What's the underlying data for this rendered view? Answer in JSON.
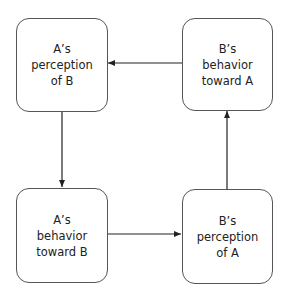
{
  "diagram": {
    "type": "cycle",
    "nodes": [
      {
        "id": "a_perception",
        "label": "A’s\nperception\nof B"
      },
      {
        "id": "b_behavior",
        "label": "B’s\nbehavior\ntoward A"
      },
      {
        "id": "a_behavior",
        "label": "A’s\nbehavior\ntoward B"
      },
      {
        "id": "b_perception",
        "label": "B’s\nperception\nof A"
      }
    ],
    "edges": [
      {
        "from": "a_perception",
        "to": "a_behavior"
      },
      {
        "from": "a_behavior",
        "to": "b_perception"
      },
      {
        "from": "b_perception",
        "to": "b_behavior"
      },
      {
        "from": "b_behavior",
        "to": "a_perception"
      }
    ],
    "colors": {
      "stroke": "#555555",
      "arrow": "#222222",
      "text": "#222222"
    }
  }
}
